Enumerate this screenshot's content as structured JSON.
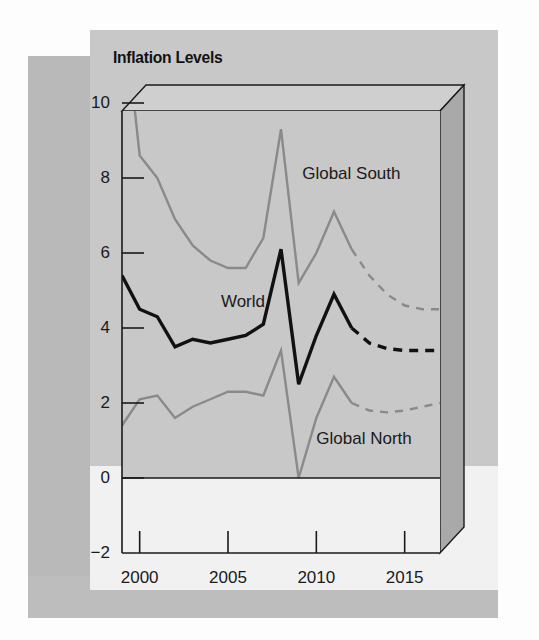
{
  "figure": {
    "title": "Inflation Levels"
  },
  "chart_data": {
    "type": "line",
    "title": "Inflation Levels",
    "xlabel": "",
    "ylabel": "",
    "xlim": [
      1999,
      2017
    ],
    "ylim": [
      -2,
      13
    ],
    "xticks": [
      2000,
      2005,
      2010,
      2015
    ],
    "xtick_labels": [
      "2000",
      "2005",
      "2010",
      "2015"
    ],
    "yticks": [
      -2,
      0,
      2,
      4,
      6,
      8,
      10
    ],
    "ytick_labels": [
      "-2",
      "0",
      "2",
      "4",
      "6",
      "8",
      "10"
    ],
    "grid": false,
    "legend": "inline-annotations",
    "zero_line": 0,
    "forecast_starts": 2012,
    "x": [
      1999,
      2000,
      2001,
      2002,
      2003,
      2004,
      2005,
      2006,
      2007,
      2008,
      2009,
      2010,
      2011,
      2012,
      2013,
      2014,
      2015,
      2016,
      2017
    ],
    "series": [
      {
        "name": "Global South",
        "label": "Global South",
        "color": "#8a8a8a",
        "style": "solid-then-dashed",
        "values": [
          13.0,
          8.6,
          8.0,
          6.9,
          6.2,
          5.8,
          5.6,
          5.6,
          6.4,
          9.3,
          5.2,
          6.0,
          7.1,
          6.1,
          5.4,
          4.9,
          4.6,
          4.5,
          4.5
        ]
      },
      {
        "name": "World",
        "label": "World",
        "color": "#111111",
        "style": "solid-then-dashed",
        "values": [
          5.4,
          4.5,
          4.3,
          3.5,
          3.7,
          3.6,
          3.7,
          3.8,
          4.1,
          6.1,
          2.5,
          3.8,
          4.9,
          4.0,
          3.6,
          3.45,
          3.4,
          3.4,
          3.4
        ]
      },
      {
        "name": "Global North",
        "label": "Global North",
        "color": "#8a8a8a",
        "style": "solid-then-dashed",
        "values": [
          1.4,
          2.1,
          2.2,
          1.6,
          1.9,
          2.1,
          2.3,
          2.3,
          2.2,
          3.4,
          0.0,
          1.6,
          2.7,
          2.0,
          1.8,
          1.75,
          1.8,
          1.9,
          2.0
        ]
      }
    ],
    "annotations": [
      {
        "text": "Global South",
        "x": 2009.2,
        "y": 8.1
      },
      {
        "text": "World",
        "x": 2004.6,
        "y": 4.7
      },
      {
        "text": "Global North",
        "x": 2010.0,
        "y": 1.05
      }
    ]
  },
  "style": {
    "plot_bg": "#c8c8c8",
    "below_zero_bg": "#f1f1f1",
    "box_side": "#a9a9a9",
    "box_top": "#cfcfcf",
    "axis_color": "#1a1a1a",
    "gray_series": "#8a8a8a",
    "black_series": "#111111"
  }
}
